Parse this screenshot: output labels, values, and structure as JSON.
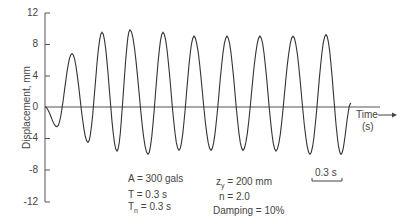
{
  "chart_data": {
    "type": "line",
    "title": "",
    "xlabel": "Time (s)",
    "ylabel": "Displacement, mm",
    "ylim": [
      -12,
      12
    ],
    "yticks": [
      12,
      8,
      4,
      0,
      -4,
      -8,
      -12
    ],
    "ytick_labels": [
      "12",
      "8",
      "4",
      "0",
      "-4",
      "-8",
      "-12"
    ],
    "grid": false,
    "scale_bar": "0.3 s",
    "series": [
      {
        "name": "Displacement response",
        "x_px": [
          45,
          57,
          72,
          88,
          102,
          117,
          130,
          148,
          163,
          179,
          194,
          211,
          227,
          243,
          260,
          276,
          293,
          310,
          326,
          341,
          351
        ],
        "values": [
          0,
          -2.5,
          6.8,
          -4.5,
          9.5,
          -5.6,
          9.8,
          -6.0,
          9.5,
          -5.5,
          9.0,
          -5.5,
          9.0,
          -5.5,
          9.0,
          -5.6,
          9.0,
          -6.0,
          9.2,
          -6.0,
          0.5
        ]
      }
    ],
    "annotations": {
      "A": "A = 300 gals",
      "T": "T = 0.3 s",
      "Tn": "0.3 s",
      "zy": "= 200 mm",
      "n": "n = 2.0",
      "damping": "Damping = 10%"
    }
  },
  "labels": {
    "ylabel": "Displacement, mm",
    "time": "Time",
    "time_unit": "(s)",
    "scale_bar": "0.3 s",
    "A": "A = 300 gals",
    "T": "T = 0.3 s",
    "Tn_T": "T",
    "Tn_sub": "n",
    "Tn_rest": " = 0.3 s",
    "zy_z": "z",
    "zy_sub": "y",
    "zy_rest": " = 200 mm",
    "n": "n = 2.0",
    "damping": "Damping = 10%"
  },
  "ticks": [
    "12",
    "8",
    "4",
    "0",
    "-4",
    "-8",
    "-12"
  ]
}
